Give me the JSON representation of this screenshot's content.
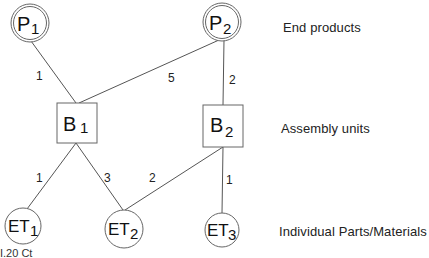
{
  "diagram": {
    "nodes": {
      "P1": {
        "letter": "P",
        "sub": "1"
      },
      "P2": {
        "letter": "P",
        "sub": "2"
      },
      "B1": {
        "letter": "B",
        "sub": "1"
      },
      "B2": {
        "letter": "B",
        "sub": "2"
      },
      "ET1": {
        "letter": "ET",
        "sub": "1"
      },
      "ET2": {
        "letter": "ET",
        "sub": "2"
      },
      "ET3": {
        "letter": "ET",
        "sub": "3"
      }
    },
    "edges": [
      {
        "from": "P1",
        "to": "B1",
        "label": "1"
      },
      {
        "from": "P2",
        "to": "B1",
        "label": "5"
      },
      {
        "from": "P2",
        "to": "B2",
        "label": "2"
      },
      {
        "from": "B1",
        "to": "ET1",
        "label": "1"
      },
      {
        "from": "B1",
        "to": "ET2",
        "label": "3"
      },
      {
        "from": "B2",
        "to": "ET2",
        "label": "2"
      },
      {
        "from": "B2",
        "to": "ET3",
        "label": "1"
      }
    ],
    "levels": {
      "top": "End products",
      "middle": "Assembly units",
      "bottom": "Individual Parts/Materials"
    },
    "caption_fragment": "I.20 Ct"
  }
}
